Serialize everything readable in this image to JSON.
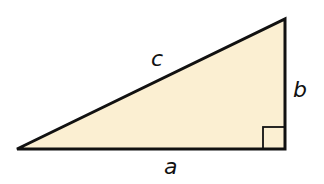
{
  "diagram": {
    "type": "right-triangle",
    "fill_color": "#fbefd2",
    "stroke_color": "#111111",
    "vertices": {
      "left": [
        17,
        149
      ],
      "top_right": [
        285,
        19
      ],
      "bottom_right": [
        285,
        149
      ]
    },
    "labels": {
      "hypotenuse": "c",
      "vertical_leg": "b",
      "horizontal_leg": "a"
    },
    "right_angle_marker": true
  }
}
